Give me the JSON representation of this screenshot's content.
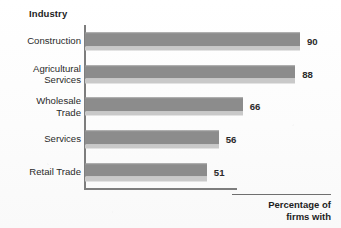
{
  "chart_data": {
    "type": "bar",
    "orientation": "horizontal",
    "title": "Industry",
    "xlabel": "Percentage of\nfirms with",
    "ylabel": "Industry",
    "categories": [
      "Construction",
      "Agricultural\nServices",
      "Wholesale\nTrade",
      "Services",
      "Retail Trade"
    ],
    "values": [
      90,
      88,
      66,
      56,
      51
    ],
    "value_labels": [
      "90",
      "88",
      "66",
      "56",
      "51"
    ],
    "xlim": [
      0,
      100
    ],
    "grid": false,
    "legend": null,
    "bar_color": "#8c8c8c",
    "bar_shadow_color": "#c9c9c9",
    "axis_color": "#7d7d7d",
    "text_color": "#2a2a2a"
  },
  "chart": {
    "title": "Industry",
    "x_caption": "Percentage of\nfirms with",
    "bars": [
      {
        "category": "Construction",
        "value": 90,
        "label": "90"
      },
      {
        "category": "Agricultural\nServices",
        "value": 88,
        "label": "88"
      },
      {
        "category": "Wholesale\nTrade",
        "value": 66,
        "label": "66"
      },
      {
        "category": "Services",
        "value": 56,
        "label": "56"
      },
      {
        "category": "Retail Trade",
        "value": 51,
        "label": "51"
      }
    ]
  }
}
